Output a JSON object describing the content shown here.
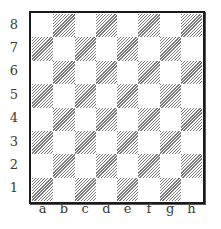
{
  "board": {
    "files": [
      "a",
      "b",
      "c",
      "d",
      "e",
      "f",
      "g",
      "h"
    ],
    "ranks": [
      "8",
      "7",
      "6",
      "5",
      "4",
      "3",
      "2",
      "1"
    ],
    "light_square_color": "#ffffff",
    "dark_square_pattern": "diagonal-hatch",
    "hatch_color": "#7a7a7a",
    "border_color": "#1a1a1a",
    "pieces": []
  }
}
